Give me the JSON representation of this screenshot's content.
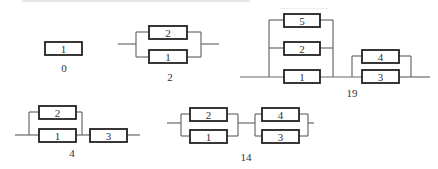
{
  "figure": {
    "colors": {
      "wire": "#6a6a6a",
      "block_border": "#222222",
      "text": "#333333",
      "background": "#ffffff"
    },
    "diagrams": [
      {
        "id": "d0",
        "caption": "0",
        "caption_pos": [
          64,
          72
        ],
        "wires": [],
        "blocks": [
          {
            "label": "1",
            "x": 45,
            "y": 42,
            "w": 37,
            "h": 13
          }
        ]
      },
      {
        "id": "d2",
        "caption": "2",
        "caption_pos": [
          170,
          81
        ],
        "wires": [
          [
            118,
            44,
            136,
            44
          ],
          [
            136,
            32,
            136,
            57
          ],
          [
            136,
            32,
            149,
            32
          ],
          [
            136,
            57,
            149,
            57
          ],
          [
            187,
            32,
            201,
            32
          ],
          [
            187,
            57,
            201,
            57
          ],
          [
            201,
            32,
            201,
            57
          ],
          [
            201,
            44,
            219,
            44
          ]
        ],
        "blocks": [
          {
            "label": "2",
            "x": 149,
            "y": 26,
            "w": 38,
            "h": 13
          },
          {
            "label": "1",
            "x": 149,
            "y": 50,
            "w": 38,
            "h": 13
          }
        ]
      },
      {
        "id": "d19",
        "caption": "19",
        "caption_pos": [
          352,
          97
        ],
        "wires": [
          [
            240,
            77,
            284,
            77
          ],
          [
            269,
            20,
            269,
            77
          ],
          [
            269,
            20,
            284,
            20
          ],
          [
            269,
            48,
            284,
            48
          ],
          [
            320,
            20,
            333,
            20
          ],
          [
            320,
            48,
            333,
            48
          ],
          [
            333,
            20,
            333,
            77
          ],
          [
            320,
            77,
            362,
            77
          ],
          [
            352,
            56,
            352,
            77
          ],
          [
            352,
            56,
            362,
            56
          ],
          [
            399,
            56,
            411,
            56
          ],
          [
            411,
            56,
            411,
            77
          ],
          [
            399,
            77,
            430,
            77
          ]
        ],
        "blocks": [
          {
            "label": "5",
            "x": 284,
            "y": 14,
            "w": 36,
            "h": 13
          },
          {
            "label": "2",
            "x": 284,
            "y": 42,
            "w": 36,
            "h": 13
          },
          {
            "label": "1",
            "x": 284,
            "y": 70,
            "w": 36,
            "h": 13
          },
          {
            "label": "4",
            "x": 362,
            "y": 50,
            "w": 37,
            "h": 13
          },
          {
            "label": "3",
            "x": 362,
            "y": 70,
            "w": 37,
            "h": 13
          }
        ]
      },
      {
        "id": "d4",
        "caption": "4",
        "caption_pos": [
          72,
          157
        ],
        "wires": [
          [
            15,
            135,
            39,
            135
          ],
          [
            29,
            112,
            29,
            135
          ],
          [
            29,
            112,
            39,
            112
          ],
          [
            76,
            112,
            82,
            112
          ],
          [
            82,
            112,
            82,
            135
          ],
          [
            76,
            135,
            90,
            135
          ],
          [
            127,
            135,
            140,
            135
          ]
        ],
        "blocks": [
          {
            "label": "2",
            "x": 39,
            "y": 106,
            "w": 37,
            "h": 13
          },
          {
            "label": "1",
            "x": 39,
            "y": 129,
            "w": 37,
            "h": 13
          },
          {
            "label": "3",
            "x": 90,
            "y": 129,
            "w": 37,
            "h": 13
          }
        ]
      },
      {
        "id": "d14",
        "caption": "14",
        "caption_pos": [
          246,
          161
        ],
        "wires": [
          [
            167,
            123,
            181,
            123
          ],
          [
            181,
            114,
            181,
            136
          ],
          [
            181,
            114,
            190,
            114
          ],
          [
            181,
            136,
            190,
            136
          ],
          [
            227,
            114,
            238,
            114
          ],
          [
            227,
            136,
            238,
            136
          ],
          [
            238,
            114,
            238,
            136
          ],
          [
            238,
            123,
            255,
            123
          ],
          [
            255,
            114,
            255,
            136
          ],
          [
            255,
            114,
            262,
            114
          ],
          [
            255,
            136,
            262,
            136
          ],
          [
            299,
            114,
            308,
            114
          ],
          [
            299,
            136,
            308,
            136
          ],
          [
            308,
            114,
            308,
            136
          ],
          [
            308,
            123,
            314,
            123
          ]
        ],
        "blocks": [
          {
            "label": "2",
            "x": 190,
            "y": 108,
            "w": 37,
            "h": 13
          },
          {
            "label": "1",
            "x": 190,
            "y": 130,
            "w": 37,
            "h": 13
          },
          {
            "label": "4",
            "x": 262,
            "y": 108,
            "w": 37,
            "h": 13
          },
          {
            "label": "3",
            "x": 262,
            "y": 130,
            "w": 37,
            "h": 13
          }
        ]
      }
    ]
  }
}
